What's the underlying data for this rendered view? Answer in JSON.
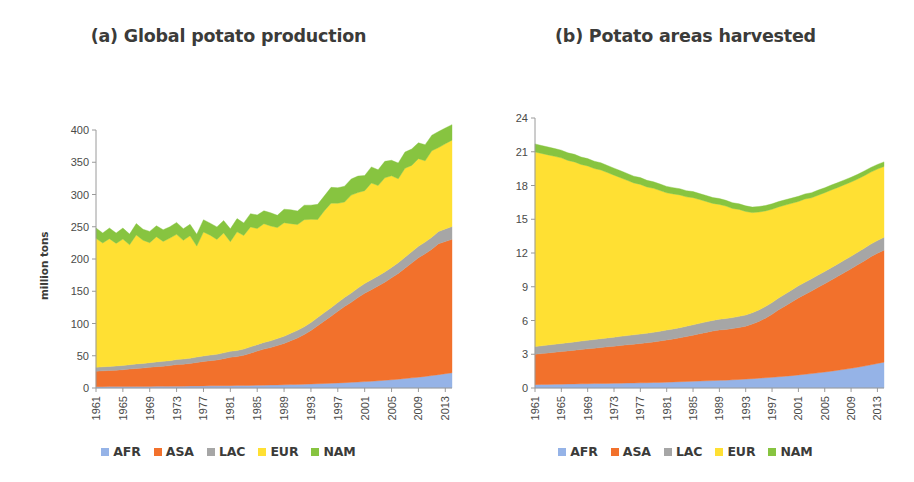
{
  "figure": {
    "panels": [
      {
        "id": "panel-a",
        "title": "(a) Global potato production",
        "ylabel": "million tons"
      },
      {
        "id": "panel-b",
        "title": "(b) Potato areas harvested",
        "ylabel": "million hectares"
      }
    ],
    "legend": [
      {
        "label": "AFR",
        "color": "#95b3e7"
      },
      {
        "label": "ASA",
        "color": "#f2712c"
      },
      {
        "label": "LAC",
        "color": "#a6a6a6"
      },
      {
        "label": "EUR",
        "color": "#ffe033"
      },
      {
        "label": "NAM",
        "color": "#87c440"
      }
    ]
  },
  "chart_data": [
    {
      "type": "area",
      "stacked": true,
      "title": "(a) Global potato production",
      "xlabel": "",
      "ylabel": "million tons",
      "ylim": [
        0,
        400
      ],
      "yticks": [
        0,
        50,
        100,
        150,
        200,
        250,
        300,
        350,
        400
      ],
      "grid": false,
      "legend_position": "bottom",
      "x": [
        1961,
        1962,
        1963,
        1964,
        1965,
        1966,
        1967,
        1968,
        1969,
        1970,
        1971,
        1972,
        1973,
        1974,
        1975,
        1976,
        1977,
        1978,
        1979,
        1980,
        1981,
        1982,
        1983,
        1984,
        1985,
        1986,
        1987,
        1988,
        1989,
        1990,
        1991,
        1992,
        1993,
        1994,
        1995,
        1996,
        1997,
        1998,
        1999,
        2000,
        2001,
        2002,
        2003,
        2004,
        2005,
        2006,
        2007,
        2008,
        2009,
        2010,
        2011,
        2012,
        2013,
        2014
      ],
      "xtick_labels": [
        "1961",
        "1965",
        "1969",
        "1973",
        "1977",
        "1981",
        "1985",
        "1989",
        "1993",
        "1997",
        "2001",
        "2005",
        "2009",
        "2013"
      ],
      "series": [
        {
          "name": "AFR",
          "color": "#95b3e7",
          "values": [
            2.0,
            2.1,
            2.2,
            2.2,
            2.3,
            2.3,
            2.4,
            2.5,
            2.5,
            2.6,
            2.7,
            2.7,
            2.8,
            2.9,
            3.0,
            3.1,
            3.2,
            3.3,
            3.4,
            3.5,
            3.6,
            3.7,
            3.8,
            4.0,
            4.2,
            4.4,
            4.6,
            4.8,
            5.0,
            5.3,
            5.6,
            5.9,
            6.2,
            6.6,
            7.0,
            7.4,
            7.8,
            8.3,
            8.8,
            9.3,
            9.9,
            10.5,
            11.2,
            12.0,
            12.8,
            13.7,
            14.7,
            15.7,
            16.8,
            18.0,
            19.3,
            20.7,
            22.2,
            23.5
          ]
        },
        {
          "name": "ASA",
          "color": "#f2712c",
          "values": [
            24.0,
            24.5,
            25.0,
            25.5,
            26.0,
            27.0,
            28.0,
            28.5,
            29.5,
            30.5,
            31.0,
            32.0,
            33.5,
            34.0,
            35.0,
            36.5,
            38.0,
            39.0,
            40.0,
            42.0,
            44.0,
            45.0,
            47.0,
            50.0,
            53.0,
            56.0,
            58.0,
            61.0,
            64.0,
            68.0,
            72.0,
            77.0,
            83.0,
            90.0,
            97.0,
            104.0,
            111.0,
            118.0,
            124.0,
            131.0,
            137.0,
            142.0,
            147.0,
            152.0,
            158.0,
            164.0,
            171.0,
            178.0,
            185.0,
            190.0,
            196.0,
            203.0,
            205.0,
            207.0
          ]
        },
        {
          "name": "LAC",
          "color": "#a6a6a6",
          "values": [
            6.0,
            6.2,
            6.3,
            6.5,
            6.6,
            6.8,
            7.0,
            7.1,
            7.3,
            7.4,
            7.6,
            7.7,
            7.9,
            8.0,
            8.2,
            8.4,
            8.6,
            8.7,
            8.9,
            9.0,
            9.2,
            9.4,
            9.6,
            9.8,
            10.0,
            10.3,
            10.6,
            10.9,
            11.2,
            11.5,
            11.8,
            12.0,
            12.3,
            12.6,
            12.9,
            13.2,
            13.6,
            14.0,
            14.3,
            14.7,
            15.0,
            15.3,
            15.6,
            15.9,
            16.2,
            16.6,
            17.0,
            17.4,
            17.8,
            18.2,
            18.6,
            19.0,
            19.4,
            19.8
          ]
        },
        {
          "name": "EUR",
          "color": "#ffe033",
          "values": [
            200.0,
            192.0,
            198.0,
            190.0,
            196.0,
            186.0,
            200.0,
            191.0,
            186.0,
            194.0,
            186.0,
            190.0,
            194.0,
            184.0,
            190.0,
            172.0,
            192.0,
            186.0,
            178.0,
            186.0,
            170.0,
            184.0,
            176.0,
            186.0,
            180.0,
            184.0,
            178.0,
            172.0,
            176.0,
            170.0,
            164.0,
            166.0,
            160.0,
            152.0,
            158.0,
            162.0,
            154.0,
            148.0,
            152.0,
            148.0,
            144.0,
            150.0,
            140.0,
            146.0,
            142.0,
            130.0,
            138.0,
            134.0,
            136.0,
            126.0,
            134.0,
            130.0,
            132.0,
            134.0
          ]
        },
        {
          "name": "NAM",
          "color": "#87c440",
          "values": [
            16.0,
            15.5,
            16.5,
            16.0,
            17.0,
            16.5,
            17.5,
            17.0,
            17.5,
            17.0,
            18.0,
            17.5,
            18.5,
            18.0,
            17.5,
            18.5,
            19.0,
            18.5,
            19.5,
            19.0,
            20.0,
            20.5,
            19.5,
            20.5,
            21.0,
            20.0,
            20.5,
            19.0,
            21.0,
            21.5,
            21.0,
            22.5,
            22.0,
            23.5,
            23.0,
            24.5,
            24.0,
            24.5,
            25.0,
            25.5,
            23.5,
            25.0,
            24.5,
            25.5,
            24.0,
            24.5,
            25.0,
            25.5,
            24.5,
            25.0,
            24.0,
            25.0,
            24.5,
            24.0
          ]
        }
      ]
    },
    {
      "type": "area",
      "stacked": true,
      "title": "(b) Potato areas harvested",
      "xlabel": "",
      "ylabel": "million hectares",
      "ylim": [
        0,
        24
      ],
      "yticks": [
        0,
        3,
        6,
        9,
        12,
        15,
        18,
        21,
        24
      ],
      "grid": false,
      "legend_position": "bottom",
      "x": [
        1961,
        1962,
        1963,
        1964,
        1965,
        1966,
        1967,
        1968,
        1969,
        1970,
        1971,
        1972,
        1973,
        1974,
        1975,
        1976,
        1977,
        1978,
        1979,
        1980,
        1981,
        1982,
        1983,
        1984,
        1985,
        1986,
        1987,
        1988,
        1989,
        1990,
        1991,
        1992,
        1993,
        1994,
        1995,
        1996,
        1997,
        1998,
        1999,
        2000,
        2001,
        2002,
        2003,
        2004,
        2005,
        2006,
        2007,
        2008,
        2009,
        2010,
        2011,
        2012,
        2013,
        2014
      ],
      "xtick_labels": [
        "1961",
        "1965",
        "1969",
        "1973",
        "1977",
        "1981",
        "1985",
        "1989",
        "1993",
        "1997",
        "2001",
        "2005",
        "2009",
        "2013"
      ],
      "series": [
        {
          "name": "AFR",
          "color": "#95b3e7",
          "values": [
            0.3,
            0.31,
            0.32,
            0.33,
            0.34,
            0.35,
            0.36,
            0.37,
            0.38,
            0.39,
            0.4,
            0.41,
            0.42,
            0.43,
            0.44,
            0.45,
            0.46,
            0.47,
            0.49,
            0.5,
            0.52,
            0.54,
            0.56,
            0.58,
            0.6,
            0.62,
            0.64,
            0.66,
            0.68,
            0.7,
            0.73,
            0.76,
            0.79,
            0.83,
            0.87,
            0.91,
            0.95,
            1.0,
            1.05,
            1.1,
            1.16,
            1.22,
            1.28,
            1.35,
            1.42,
            1.5,
            1.58,
            1.66,
            1.75,
            1.85,
            1.95,
            2.06,
            2.18,
            2.3
          ]
        },
        {
          "name": "ASA",
          "color": "#f2712c",
          "values": [
            2.7,
            2.75,
            2.8,
            2.85,
            2.9,
            2.95,
            3.0,
            3.05,
            3.1,
            3.15,
            3.2,
            3.25,
            3.3,
            3.35,
            3.4,
            3.45,
            3.5,
            3.55,
            3.6,
            3.68,
            3.75,
            3.82,
            3.9,
            4.0,
            4.1,
            4.2,
            4.3,
            4.4,
            4.48,
            4.5,
            4.55,
            4.62,
            4.7,
            4.85,
            5.05,
            5.3,
            5.6,
            5.95,
            6.25,
            6.55,
            6.85,
            7.1,
            7.35,
            7.6,
            7.85,
            8.1,
            8.35,
            8.6,
            8.85,
            9.1,
            9.35,
            9.6,
            9.8,
            9.95
          ]
        },
        {
          "name": "LAC",
          "color": "#a6a6a6",
          "values": [
            0.68,
            0.69,
            0.7,
            0.71,
            0.72,
            0.73,
            0.74,
            0.75,
            0.76,
            0.77,
            0.78,
            0.79,
            0.8,
            0.81,
            0.82,
            0.83,
            0.84,
            0.85,
            0.86,
            0.87,
            0.88,
            0.89,
            0.9,
            0.91,
            0.92,
            0.93,
            0.94,
            0.95,
            0.96,
            0.97,
            0.98,
            0.99,
            1.0,
            1.01,
            1.02,
            1.03,
            1.04,
            1.05,
            1.06,
            1.07,
            1.07,
            1.08,
            1.08,
            1.09,
            1.09,
            1.1,
            1.1,
            1.11,
            1.11,
            1.12,
            1.12,
            1.13,
            1.13,
            1.14
          ]
        },
        {
          "name": "EUR",
          "color": "#ffe033",
          "values": [
            17.3,
            17.1,
            16.9,
            16.7,
            16.5,
            16.2,
            16.0,
            15.7,
            15.5,
            15.2,
            15.0,
            14.7,
            14.4,
            14.1,
            13.8,
            13.5,
            13.3,
            13.0,
            12.8,
            12.5,
            12.2,
            12.0,
            11.8,
            11.5,
            11.3,
            11.0,
            10.7,
            10.4,
            10.2,
            10.0,
            9.7,
            9.5,
            9.2,
            8.9,
            8.7,
            8.5,
            8.3,
            8.1,
            7.9,
            7.7,
            7.5,
            7.4,
            7.2,
            7.1,
            7.0,
            6.9,
            6.8,
            6.7,
            6.6,
            6.5,
            6.45,
            6.4,
            6.35,
            6.3
          ]
        },
        {
          "name": "NAM",
          "color": "#87c440",
          "values": [
            0.72,
            0.7,
            0.7,
            0.69,
            0.68,
            0.67,
            0.67,
            0.66,
            0.65,
            0.65,
            0.64,
            0.63,
            0.62,
            0.62,
            0.61,
            0.6,
            0.6,
            0.59,
            0.58,
            0.58,
            0.57,
            0.56,
            0.55,
            0.55,
            0.54,
            0.53,
            0.53,
            0.52,
            0.52,
            0.51,
            0.51,
            0.5,
            0.5,
            0.49,
            0.49,
            0.48,
            0.48,
            0.47,
            0.47,
            0.46,
            0.46,
            0.45,
            0.45,
            0.45,
            0.44,
            0.44,
            0.43,
            0.43,
            0.42,
            0.42,
            0.42,
            0.41,
            0.41,
            0.41
          ]
        }
      ]
    }
  ]
}
